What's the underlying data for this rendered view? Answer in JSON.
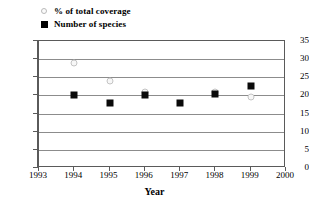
{
  "chart_data": {
    "type": "scatter",
    "title": "",
    "xlabel": "Year",
    "ylabel": "",
    "xlim": [
      1993,
      2000
    ],
    "ylim": [
      0,
      35
    ],
    "ytick_step": 5,
    "grid": true,
    "legend_position": "top-left",
    "xticks": [
      "1993",
      "1994",
      "1995",
      "1996",
      "1997",
      "1998",
      "1999",
      "2000"
    ],
    "yticks": [
      "0",
      "5",
      "10",
      "15",
      "20",
      "25",
      "30",
      "35"
    ],
    "series": [
      {
        "name": "% of  total coverage",
        "marker": "open-circle",
        "color": "#fbfbfb",
        "edge_color": "#bdbdbd",
        "points": [
          {
            "x": 1994,
            "y": 29
          },
          {
            "x": 1995,
            "y": 24
          },
          {
            "x": 1996,
            "y": 21
          },
          {
            "x": 1998,
            "y": 21
          },
          {
            "x": 1999,
            "y": 19.5
          }
        ]
      },
      {
        "name": "Number of species",
        "marker": "filled-square",
        "color": "#0a0a0a",
        "edge_color": "#0a0a0a",
        "points": [
          {
            "x": 1994,
            "y": 20
          },
          {
            "x": 1995,
            "y": 18
          },
          {
            "x": 1996,
            "y": 20
          },
          {
            "x": 1997,
            "y": 18
          },
          {
            "x": 1998,
            "y": 20.5
          },
          {
            "x": 1999,
            "y": 22.5
          }
        ]
      }
    ]
  }
}
